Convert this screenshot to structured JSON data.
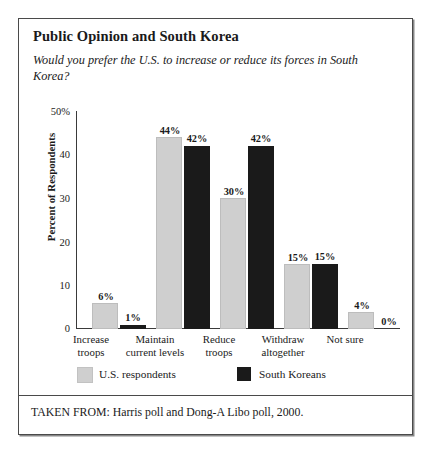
{
  "figure": {
    "title": "Public Opinion and South Korea",
    "subtitle": "Would you prefer the U.S. to increase or reduce its forces in South Korea?",
    "source_note": "TAKEN FROM: Harris poll and Dong-A Libo poll, 2000."
  },
  "colors": {
    "us_respondents": "#cfcfcf",
    "south_koreans": "#1a1a1a",
    "frame": "#4a4a4a",
    "axis": "#3a3a3a",
    "background": "#ffffff"
  },
  "legend": {
    "position": "bottom-left",
    "entries": [
      {
        "label": "U.S. respondents",
        "swatch": "#cfcfcf"
      },
      {
        "label": "South Koreans",
        "swatch": "#1a1a1a"
      }
    ]
  },
  "chart_data": {
    "type": "bar",
    "title": "Public Opinion and South Korea",
    "subtitle": "Would you prefer the U.S. to increase or reduce its forces in South Korea?",
    "xlabel": "",
    "ylabel": "Percent of Respondents",
    "ylim": [
      0,
      50
    ],
    "yticks": [
      0,
      10,
      20,
      30,
      40,
      50
    ],
    "ytick_labels": [
      "0",
      "10",
      "20",
      "30",
      "40",
      "50%"
    ],
    "grid": false,
    "legend_position": "bottom-left",
    "categories": [
      "Increase troops",
      "Maintain current levels",
      "Reduce troops",
      "Withdraw altogether",
      "Not sure"
    ],
    "category_lines": [
      [
        "Increase",
        "troops"
      ],
      [
        "Maintain",
        "current levels"
      ],
      [
        "Reduce",
        "troops"
      ],
      [
        "Withdraw",
        "altogether"
      ],
      [
        "Not sure",
        ""
      ]
    ],
    "series": [
      {
        "name": "U.S. respondents",
        "color": "#cfcfcf",
        "values": [
          6,
          44,
          30,
          15,
          4
        ],
        "labels": [
          "6%",
          "44%",
          "30%",
          "15%",
          "4%"
        ]
      },
      {
        "name": "South Koreans",
        "color": "#1a1a1a",
        "values": [
          1,
          42,
          42,
          15,
          0
        ],
        "labels": [
          "1%",
          "42%",
          "42%",
          "15%",
          "0%"
        ]
      }
    ]
  }
}
